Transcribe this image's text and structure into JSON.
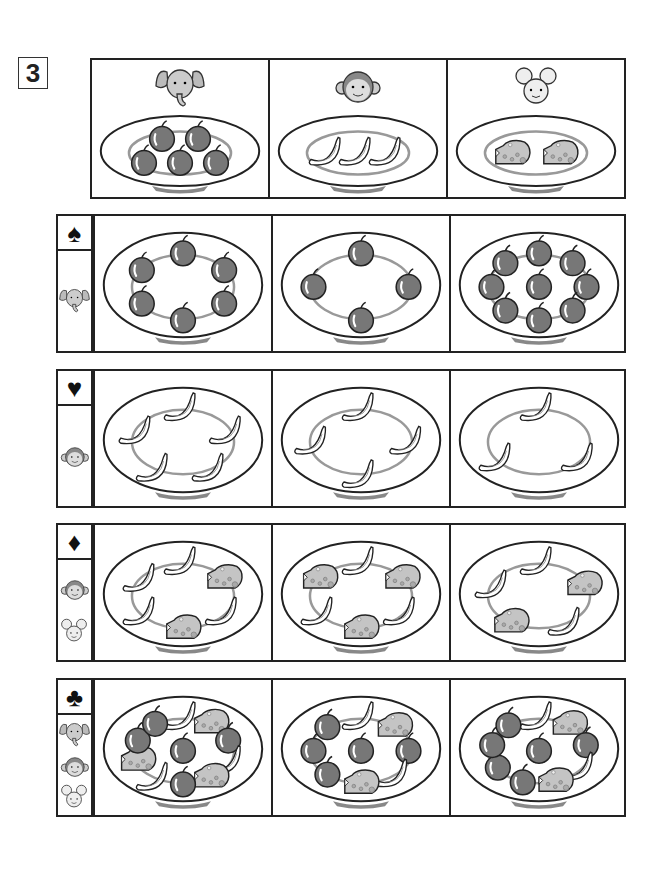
{
  "question_number": "3",
  "reference": [
    {
      "animal": "elephant",
      "food": "apple",
      "count": 5
    },
    {
      "animal": "monkey",
      "food": "banana",
      "count": 3
    },
    {
      "animal": "mouse",
      "food": "cheese",
      "count": 2
    }
  ],
  "rows": [
    {
      "suit": "♠",
      "suit_name": "spade",
      "animals": [
        "elephant"
      ],
      "plates": [
        {
          "apple": 6,
          "banana": 0,
          "cheese": 0
        },
        {
          "apple": 4,
          "banana": 0,
          "cheese": 0
        },
        {
          "apple": 9,
          "banana": 0,
          "cheese": 0
        }
      ]
    },
    {
      "suit": "♥",
      "suit_name": "heart",
      "animals": [
        "monkey"
      ],
      "plates": [
        {
          "apple": 0,
          "banana": 5,
          "cheese": 0
        },
        {
          "apple": 0,
          "banana": 4,
          "cheese": 0
        },
        {
          "apple": 0,
          "banana": 3,
          "cheese": 0
        }
      ]
    },
    {
      "suit": "♦",
      "suit_name": "diamond",
      "animals": [
        "monkey",
        "mouse"
      ],
      "plates": [
        {
          "apple": 0,
          "banana": 4,
          "cheese": 2
        },
        {
          "apple": 0,
          "banana": 3,
          "cheese": 3
        },
        {
          "apple": 0,
          "banana": 3,
          "cheese": 2
        }
      ]
    },
    {
      "suit": "♣",
      "suit_name": "club",
      "animals": [
        "elephant",
        "monkey",
        "mouse"
      ],
      "plates": [
        {
          "apple": 5,
          "banana": 3,
          "cheese": 3
        },
        {
          "apple": 5,
          "banana": 2,
          "cheese": 2
        },
        {
          "apple": 6,
          "banana": 2,
          "cheese": 2
        }
      ]
    }
  ],
  "colors": {
    "apple": "#777777",
    "cheese": "#c4c4c4",
    "plate_ring": "#999999",
    "line": "#222222"
  }
}
